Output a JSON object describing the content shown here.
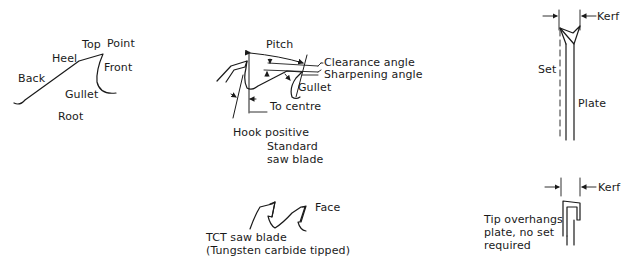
{
  "colors": {
    "ink": "#1a1a1a",
    "background": "#ffffff"
  },
  "tooth_anatomy": {
    "labels": {
      "top": "Top",
      "point": "Point",
      "heel": "Heel",
      "front": "Front",
      "back": "Back",
      "gullet": "Gullet",
      "root": "Root"
    }
  },
  "standard_blade": {
    "labels": {
      "pitch": "Pitch",
      "clearance_angle": "Clearance angle",
      "sharpening_angle": "Sharpening angle",
      "gullet": "Gullet",
      "to_centre_line1": "To centre",
      "to_centre_line2": "of blade",
      "hook_positive": "Hook positive",
      "caption_line1": "Standard",
      "caption_line2": "saw blade"
    }
  },
  "tct_blade": {
    "labels": {
      "face": "Face",
      "caption_line1": "TCT saw blade",
      "caption_line2": "(Tungsten carbide tipped)"
    }
  },
  "set_view": {
    "labels": {
      "kerf": "Kerf",
      "set": "Set",
      "plate": "Plate"
    }
  },
  "tct_kerf_view": {
    "labels": {
      "kerf": "Kerf",
      "caption_line1": "Tip overhangs",
      "caption_line2": "plate, no set",
      "caption_line3": "required"
    }
  }
}
